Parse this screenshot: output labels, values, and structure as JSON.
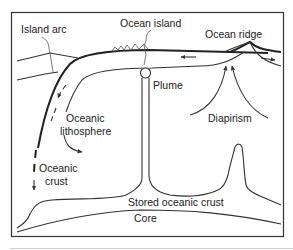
{
  "diagram": {
    "labels": {
      "island_arc": "Island arc",
      "ocean_island": "Ocean island",
      "ocean_ridge": "Ocean ridge",
      "plume": "Plume",
      "oceanic_lithosphere_line1": "Oceanic",
      "oceanic_lithosphere_line2": "lithosphere",
      "diapirism": "Diapirism",
      "oceanic_crust_line1": "Oceanic",
      "oceanic_crust_line2": "crust",
      "stored_oceanic_crust": "Stored oceanic crust",
      "core": "Core"
    },
    "colors": {
      "stroke": "#222222",
      "background": "#ffffff",
      "frame": "#333333"
    }
  }
}
